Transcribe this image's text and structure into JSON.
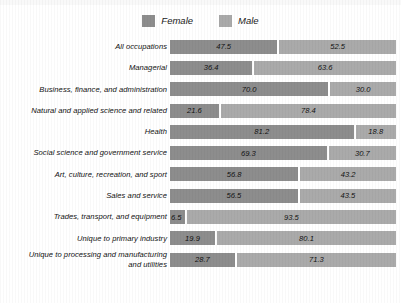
{
  "legend": {
    "entries": [
      {
        "label": "Female",
        "color": "#8d8d8d",
        "swatch_name": "legend-swatch-female"
      },
      {
        "label": "Male",
        "color": "#aaaaaa",
        "swatch_name": "legend-swatch-male"
      }
    ]
  },
  "chart_data": {
    "type": "bar",
    "subtype": "stacked-horizontal-100-percent",
    "title": "",
    "subtitle": "",
    "xlabel": "",
    "ylabel": "",
    "xlim": [
      0,
      100
    ],
    "grid": false,
    "legend_position": "top-center",
    "orientation": "horizontal",
    "stacked": true,
    "value_labels_shown": true,
    "value_label_format": "one-decimal",
    "categories": [
      "All occupations",
      "Managerial",
      "Business, finance, and administration",
      "Natural and applied science and related",
      "Health",
      "Social science and government service",
      "Art, culture, recreation, and sport",
      "Sales and service",
      "Trades, transport, and equipment",
      "Unique to primary industry",
      "Unique to processing and manufacturing and utilities"
    ],
    "series": [
      {
        "name": "Female",
        "color": "#8d8d8d",
        "values": [
          47.5,
          36.4,
          70.0,
          21.6,
          81.2,
          69.3,
          56.8,
          56.5,
          6.5,
          19.9,
          28.7
        ]
      },
      {
        "name": "Male",
        "color": "#aaaaaa",
        "values": [
          52.5,
          63.6,
          30.0,
          78.4,
          18.8,
          30.7,
          43.2,
          43.5,
          93.5,
          80.1,
          71.3
        ]
      }
    ]
  },
  "rows": [
    {
      "label": "All occupations",
      "label_line2": "",
      "female": "47.5",
      "male": "52.5",
      "female_pct": 47.5,
      "male_pct": 52.5
    },
    {
      "label": "Managerial",
      "label_line2": "",
      "female": "36.4",
      "male": "63.6",
      "female_pct": 36.4,
      "male_pct": 63.6
    },
    {
      "label": "Business, finance, and administration",
      "label_line2": "",
      "female": "70.0",
      "male": "30.0",
      "female_pct": 70.0,
      "male_pct": 30.0
    },
    {
      "label": "Natural and applied science and related",
      "label_line2": "",
      "female": "21.6",
      "male": "78.4",
      "female_pct": 21.6,
      "male_pct": 78.4
    },
    {
      "label": "Health",
      "label_line2": "",
      "female": "81.2",
      "male": "18.8",
      "female_pct": 81.2,
      "male_pct": 18.8
    },
    {
      "label": "Social science and government service",
      "label_line2": "",
      "female": "69.3",
      "male": "30.7",
      "female_pct": 69.3,
      "male_pct": 30.7
    },
    {
      "label": "Art, culture, recreation, and sport",
      "label_line2": "",
      "female": "56.8",
      "male": "43.2",
      "female_pct": 56.8,
      "male_pct": 43.2
    },
    {
      "label": "Sales and service",
      "label_line2": "",
      "female": "56.5",
      "male": "43.5",
      "female_pct": 56.5,
      "male_pct": 43.5
    },
    {
      "label": "Trades, transport, and equipment",
      "label_line2": "",
      "female": "6.5",
      "male": "93.5",
      "female_pct": 6.5,
      "male_pct": 93.5
    },
    {
      "label": "Unique to primary industry",
      "label_line2": "",
      "female": "19.9",
      "male": "80.1",
      "female_pct": 19.9,
      "male_pct": 80.1
    },
    {
      "label": "Unique to processing and manufacturing",
      "label_line2": "and utilities",
      "female": "28.7",
      "male": "71.3",
      "female_pct": 28.7,
      "male_pct": 71.3
    }
  ]
}
